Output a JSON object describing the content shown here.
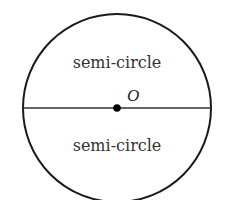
{
  "diagram": {
    "circle": {
      "cx": 117,
      "cy": 108,
      "r": 94,
      "stroke": "#1a1a1a"
    },
    "diameter": {
      "x1": 23,
      "y1": 108,
      "x2": 211,
      "y2": 108,
      "stroke": "#333333"
    },
    "center_point": {
      "x": 117,
      "y": 108,
      "label": "O"
    },
    "regions": [
      {
        "label": "semi-circle",
        "x": 117,
        "y": 68
      },
      {
        "label": "semi-circle",
        "x": 117,
        "y": 150
      }
    ]
  }
}
